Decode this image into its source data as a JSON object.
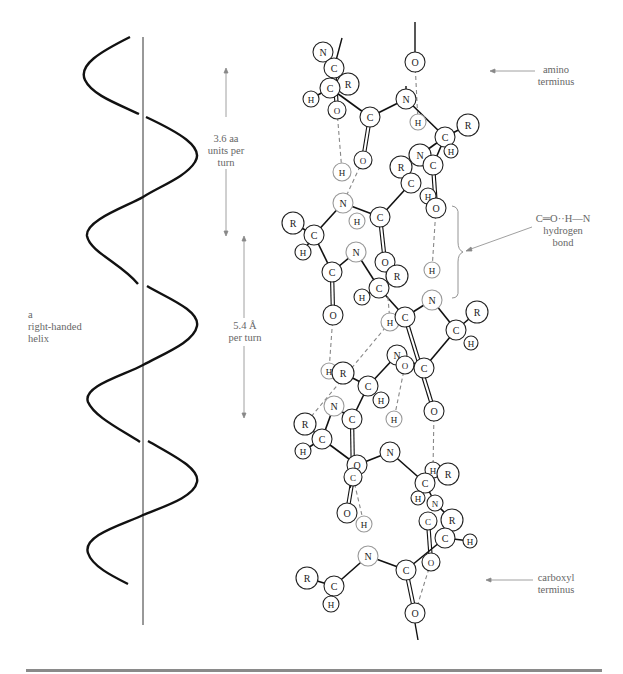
{
  "figure": {
    "helix_label": [
      "a",
      "right-handed",
      "helix"
    ],
    "residues_label": [
      "3.6 aa",
      "units per",
      "turn"
    ],
    "pitch_label": [
      "5.4 Å",
      "per turn"
    ],
    "amino_label": [
      "amino",
      "terminus"
    ],
    "hbond_label": [
      "C═O··H—N",
      "hydrogen",
      "bond"
    ],
    "carboxyl_label": [
      "carboxyl",
      "terminus"
    ]
  },
  "colors": {
    "stroke": "#111111",
    "dashed": "#888888",
    "label": "#666666",
    "rule": "#8a8a8a"
  },
  "atoms": [
    {
      "el": "N",
      "x": 323,
      "y": 52,
      "r": 10
    },
    {
      "el": "C",
      "x": 334,
      "y": 68,
      "r": 10
    },
    {
      "el": "R",
      "x": 348,
      "y": 84,
      "r": 11
    },
    {
      "el": "C",
      "x": 330,
      "y": 88,
      "r": 10
    },
    {
      "el": "H",
      "x": 311,
      "y": 99,
      "r": 8
    },
    {
      "el": "O",
      "x": 337,
      "y": 110,
      "r": 9
    },
    {
      "el": "C",
      "x": 370,
      "y": 117,
      "r": 10
    },
    {
      "el": "O",
      "x": 363,
      "y": 160,
      "r": 9
    },
    {
      "el": "O",
      "x": 415,
      "y": 62,
      "r": 10
    },
    {
      "el": "N",
      "x": 406,
      "y": 99,
      "r": 10
    },
    {
      "el": "H",
      "x": 418,
      "y": 122,
      "r": 8
    },
    {
      "el": "C",
      "x": 445,
      "y": 137,
      "r": 10
    },
    {
      "el": "R",
      "x": 468,
      "y": 125,
      "r": 11
    },
    {
      "el": "H",
      "x": 451,
      "y": 151,
      "r": 7
    },
    {
      "el": "N",
      "x": 420,
      "y": 155,
      "r": 11
    },
    {
      "el": "C",
      "x": 433,
      "y": 165,
      "r": 10
    },
    {
      "el": "R",
      "x": 401,
      "y": 167,
      "r": 11
    },
    {
      "el": "C",
      "x": 411,
      "y": 183,
      "r": 10
    },
    {
      "el": "H",
      "x": 428,
      "y": 196,
      "r": 8
    },
    {
      "el": "O",
      "x": 436,
      "y": 208,
      "r": 10
    },
    {
      "el": "H",
      "x": 342,
      "y": 172,
      "r": 9
    },
    {
      "el": "N",
      "x": 343,
      "y": 203,
      "r": 10
    },
    {
      "el": "C",
      "x": 380,
      "y": 217,
      "r": 10
    },
    {
      "el": "R",
      "x": 293,
      "y": 223,
      "r": 11
    },
    {
      "el": "C",
      "x": 314,
      "y": 235,
      "r": 10
    },
    {
      "el": "H",
      "x": 303,
      "y": 252,
      "r": 8
    },
    {
      "el": "H",
      "x": 357,
      "y": 221,
      "r": 8
    },
    {
      "el": "N",
      "x": 356,
      "y": 252,
      "r": 10
    },
    {
      "el": "C",
      "x": 332,
      "y": 272,
      "r": 10
    },
    {
      "el": "O",
      "x": 385,
      "y": 262,
      "r": 10
    },
    {
      "el": "R",
      "x": 397,
      "y": 276,
      "r": 11
    },
    {
      "el": "C",
      "x": 379,
      "y": 288,
      "r": 10
    },
    {
      "el": "H",
      "x": 362,
      "y": 297,
      "r": 8
    },
    {
      "el": "O",
      "x": 333,
      "y": 315,
      "r": 10
    },
    {
      "el": "H",
      "x": 432,
      "y": 270,
      "r": 8
    },
    {
      "el": "N",
      "x": 432,
      "y": 300,
      "r": 10
    },
    {
      "el": "H",
      "x": 390,
      "y": 322,
      "r": 9
    },
    {
      "el": "C",
      "x": 405,
      "y": 317,
      "r": 10
    },
    {
      "el": "C",
      "x": 456,
      "y": 330,
      "r": 10
    },
    {
      "el": "R",
      "x": 477,
      "y": 312,
      "r": 11
    },
    {
      "el": "H",
      "x": 471,
      "y": 343,
      "r": 7
    },
    {
      "el": "N",
      "x": 397,
      "y": 355,
      "r": 10
    },
    {
      "el": "O",
      "x": 405,
      "y": 365,
      "r": 9
    },
    {
      "el": "C",
      "x": 424,
      "y": 368,
      "r": 10
    },
    {
      "el": "O",
      "x": 434,
      "y": 411,
      "r": 10
    },
    {
      "el": "H",
      "x": 329,
      "y": 371,
      "r": 8
    },
    {
      "el": "R",
      "x": 343,
      "y": 373,
      "r": 11
    },
    {
      "el": "C",
      "x": 368,
      "y": 386,
      "r": 10
    },
    {
      "el": "H",
      "x": 381,
      "y": 400,
      "r": 8
    },
    {
      "el": "N",
      "x": 334,
      "y": 406,
      "r": 10
    },
    {
      "el": "C",
      "x": 352,
      "y": 419,
      "r": 10
    },
    {
      "el": "H",
      "x": 394,
      "y": 419,
      "r": 8
    },
    {
      "el": "R",
      "x": 305,
      "y": 424,
      "r": 11
    },
    {
      "el": "C",
      "x": 322,
      "y": 439,
      "r": 10
    },
    {
      "el": "H",
      "x": 303,
      "y": 451,
      "r": 8
    },
    {
      "el": "N",
      "x": 390,
      "y": 452,
      "r": 10
    },
    {
      "el": "O",
      "x": 357,
      "y": 465,
      "r": 10
    },
    {
      "el": "C",
      "x": 353,
      "y": 477,
      "r": 9
    },
    {
      "el": "H",
      "x": 433,
      "y": 470,
      "r": 8
    },
    {
      "el": "R",
      "x": 448,
      "y": 474,
      "r": 11
    },
    {
      "el": "C",
      "x": 425,
      "y": 483,
      "r": 10
    },
    {
      "el": "H",
      "x": 418,
      "y": 498,
      "r": 7
    },
    {
      "el": "N",
      "x": 435,
      "y": 503,
      "r": 8
    },
    {
      "el": "C",
      "x": 428,
      "y": 521,
      "r": 9
    },
    {
      "el": "R",
      "x": 452,
      "y": 520,
      "r": 11
    },
    {
      "el": "C",
      "x": 445,
      "y": 538,
      "r": 10
    },
    {
      "el": "H",
      "x": 470,
      "y": 541,
      "r": 7
    },
    {
      "el": "O",
      "x": 347,
      "y": 513,
      "r": 10
    },
    {
      "el": "H",
      "x": 364,
      "y": 524,
      "r": 8
    },
    {
      "el": "O",
      "x": 431,
      "y": 562,
      "r": 9
    },
    {
      "el": "N",
      "x": 368,
      "y": 556,
      "r": 10
    },
    {
      "el": "C",
      "x": 406,
      "y": 570,
      "r": 10
    },
    {
      "el": "R",
      "x": 307,
      "y": 578,
      "r": 11
    },
    {
      "el": "C",
      "x": 334,
      "y": 586,
      "r": 10
    },
    {
      "el": "H",
      "x": 331,
      "y": 604,
      "r": 8
    },
    {
      "el": "O",
      "x": 415,
      "y": 613,
      "r": 10
    }
  ]
}
